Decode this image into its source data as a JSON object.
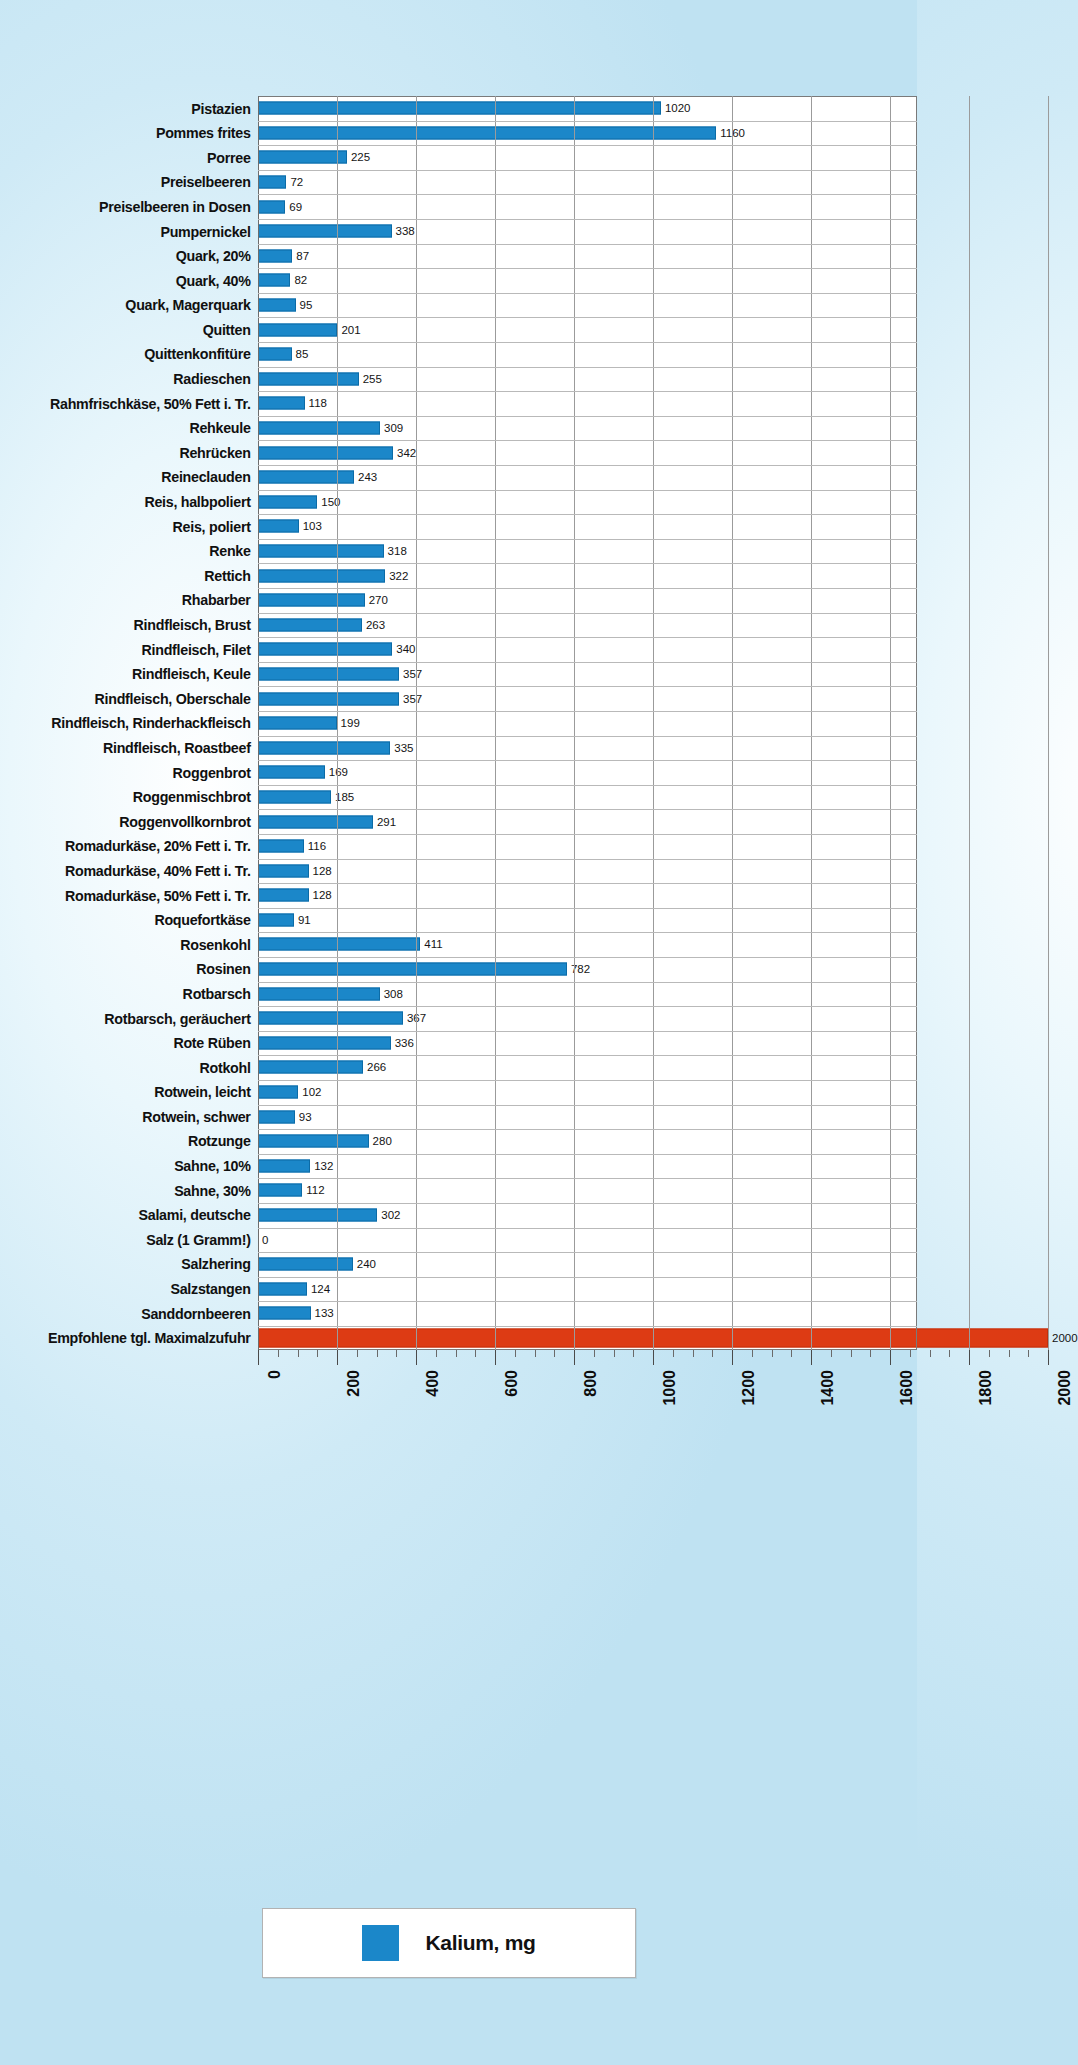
{
  "chart_data": {
    "type": "bar",
    "orientation": "horizontal",
    "title": "",
    "xlabel": "",
    "ylabel": "",
    "xlim": [
      0,
      2000
    ],
    "xticks": [
      0,
      200,
      400,
      600,
      800,
      1000,
      1200,
      1400,
      1600,
      1800,
      2000
    ],
    "minor_tick_step": 50,
    "grid": true,
    "legend": {
      "position": "bottom",
      "entries": [
        {
          "label": "Kalium, mg",
          "color": "#1b87c9"
        }
      ]
    },
    "series_name": "Kalium, mg",
    "bar_color": "#1b87c9",
    "reference_color": "#dd3b14",
    "categories": [
      "Pistazien",
      "Pommes frites",
      "Porree",
      "Preiselbeeren",
      "Preiselbeeren in Dosen",
      "Pumpernickel",
      "Quark, 20%",
      "Quark, 40%",
      "Quark, Magerquark",
      "Quitten",
      "Quittenkonfitüre",
      "Radieschen",
      "Rahmfrischkäse, 50% Fett i. Tr.",
      "Rehkeule",
      "Rehrücken",
      "Reineclauden",
      "Reis, halbpoliert",
      "Reis, poliert",
      "Renke",
      "Rettich",
      "Rhabarber",
      "Rindfleisch, Brust",
      "Rindfleisch, Filet",
      "Rindfleisch, Keule",
      "Rindfleisch, Oberschale",
      "Rindfleisch, Rinderhackfleisch",
      "Rindfleisch, Roastbeef",
      "Roggenbrot",
      "Roggenmischbrot",
      "Roggenvollkornbrot",
      "Romadurkäse, 20% Fett i. Tr.",
      "Romadurkäse, 40% Fett i. Tr.",
      "Romadurkäse, 50% Fett i. Tr.",
      "Roquefortkäse",
      "Rosenkohl",
      "Rosinen",
      "Rotbarsch",
      "Rotbarsch, geräuchert",
      "Rote Rüben",
      "Rotkohl",
      "Rotwein, leicht",
      "Rotwein, schwer",
      "Rotzunge",
      "Sahne, 10%",
      "Sahne, 30%",
      "Salami, deutsche",
      "Salz (1 Gramm!)",
      "Salzhering",
      "Salzstangen",
      "Sanddornbeeren",
      "Empfohlene tgl. Maximalzufuhr"
    ],
    "values": [
      1020,
      1160,
      225,
      72,
      69,
      338,
      87,
      82,
      95,
      201,
      85,
      255,
      118,
      309,
      342,
      243,
      150,
      103,
      318,
      322,
      270,
      263,
      340,
      357,
      357,
      199,
      335,
      169,
      185,
      291,
      116,
      128,
      128,
      91,
      411,
      782,
      308,
      367,
      336,
      266,
      102,
      93,
      280,
      132,
      112,
      302,
      0,
      240,
      124,
      133,
      2000
    ],
    "reference_index": 50
  }
}
